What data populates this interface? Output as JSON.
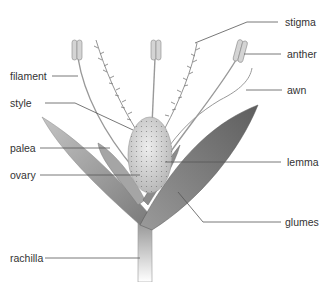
{
  "diagram": {
    "labels": {
      "stigma": "stigma",
      "anther": "anther",
      "awn": "awn",
      "filament": "filament",
      "style": "style",
      "palea": "palea",
      "ovary": "ovary",
      "lemma": "lemma",
      "glumes": "glumes",
      "rachilla": "rachilla"
    },
    "colors": {
      "background": "#ffffff",
      "label_text": "#333333",
      "leader_line": "#555555",
      "glume_dark": "#6e6e6e",
      "glume_light": "#b5b5b5",
      "ovary_fill": "#d8d8d8",
      "anther_fill": "#cfcfcf"
    }
  }
}
